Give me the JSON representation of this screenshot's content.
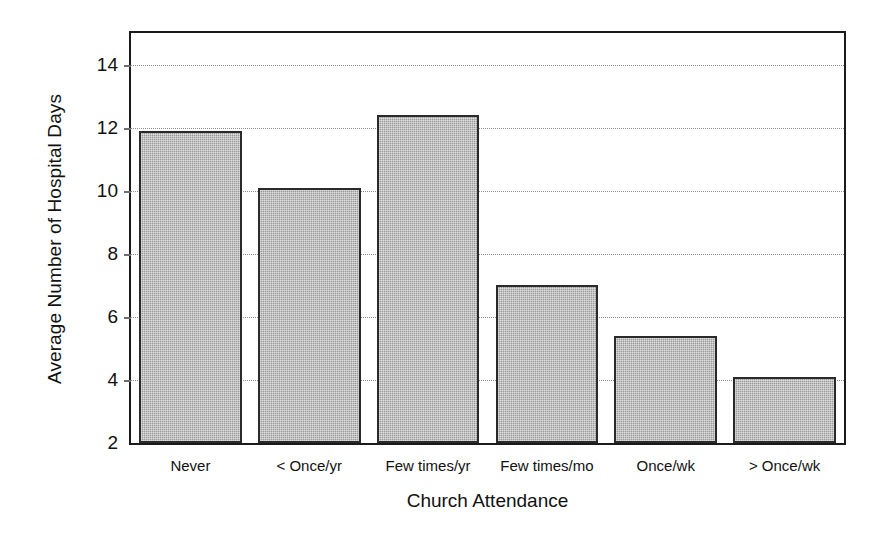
{
  "chart_data": {
    "type": "bar",
    "title": "",
    "xlabel": "Church Attendance",
    "ylabel": "Average Number of Hospital Days",
    "categories": [
      "Never",
      "< Once/yr",
      "Few times/yr",
      "Few times/mo",
      "Once/wk",
      "> Once/wk"
    ],
    "values": [
      11.9,
      10.1,
      12.4,
      7.0,
      5.4,
      4.1
    ],
    "ylim": [
      2,
      15
    ],
    "yticks": [
      14,
      12,
      10,
      8,
      6,
      4,
      2
    ],
    "ytick_labels": [
      "14",
      "12",
      "10",
      "8",
      "6",
      "4",
      "2"
    ],
    "grid": true,
    "legend": "none",
    "bar_color": "#9a9a9a",
    "bar_edge_color": "#2a2a2a",
    "axis_color": "#1b1b1b",
    "gridline_color": "#8d8d8d"
  }
}
